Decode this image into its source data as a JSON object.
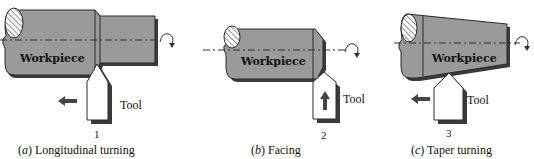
{
  "figure": {
    "colors": {
      "workpiece_fill": "#9a9a9a",
      "workpiece_shadow": "#3a3a3a",
      "outline": "#2a2a2a",
      "tool_fill": "#ffffff",
      "arrow": "#444444"
    },
    "panels": [
      {
        "id": "a",
        "workpiece_label": "Workpiece",
        "tool_label": "Tool",
        "position_number": "1",
        "caption_letter": "a",
        "caption_open": "(",
        "caption_close": ")",
        "caption_text": " Longitudinal turning",
        "feed_direction": "left"
      },
      {
        "id": "b",
        "workpiece_label": "Workpiece",
        "tool_label": "Tool",
        "position_number": "2",
        "caption_letter": "b",
        "caption_open": "(",
        "caption_close": ")",
        "caption_text": " Facing",
        "feed_direction": "up"
      },
      {
        "id": "c",
        "workpiece_label": "Workpiece",
        "tool_label": "Tool",
        "position_number": "3",
        "caption_letter": "c",
        "caption_open": "(",
        "caption_close": ")",
        "caption_text": " Taper turning",
        "feed_direction": "left"
      }
    ]
  }
}
